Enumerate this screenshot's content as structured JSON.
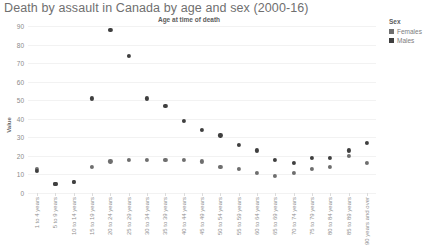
{
  "chart_data": {
    "type": "scatter",
    "title": "Death by assault in Canada by age and sex (2000-16)",
    "subtitle": "Age at time of death",
    "xlabel": "Age at time of death",
    "ylabel": "Value",
    "ylim": [
      0,
      90
    ],
    "yticks": [
      0,
      10,
      20,
      30,
      40,
      50,
      60,
      70,
      80,
      90
    ],
    "grid": true,
    "legend": {
      "title": "Sex",
      "position": "right",
      "entries": [
        {
          "name": "Females",
          "color": "#6e6e6e"
        },
        {
          "name": "Males",
          "color": "#3f3f3f"
        }
      ]
    },
    "categories": [
      "1 to 4 years",
      "5 to 9 years",
      "10 to 14 years",
      "15 to 19 years",
      "20 to 24 years",
      "25 to 29 years",
      "30 to 34 years",
      "35 to 39 years",
      "40 to 44 years",
      "45 to 49 years",
      "50 to 54 years",
      "55 to 59 years",
      "60 to 64 years",
      "65 to 69 years",
      "70 to 74 years",
      "75 to 79 years",
      "80 to 84 years",
      "85 to 89 years",
      "90 years and over"
    ],
    "series": [
      {
        "name": "Females",
        "color": "#6e6e6e",
        "values": [
          13,
          5,
          6,
          14,
          17,
          18,
          18,
          18,
          18,
          17,
          14,
          13,
          11,
          9,
          11,
          13,
          14,
          20,
          16
        ]
      },
      {
        "name": "Males",
        "color": "#3f3f3f",
        "values": [
          12,
          5,
          6,
          51,
          88,
          74,
          51,
          47,
          39,
          34,
          31,
          26,
          23,
          18,
          16,
          19,
          19,
          23,
          27
        ]
      }
    ]
  }
}
